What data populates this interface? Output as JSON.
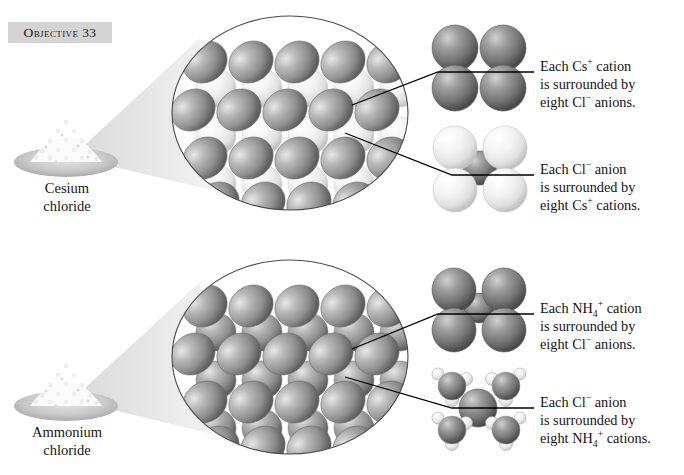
{
  "figure": {
    "objective_label": "Objective 33",
    "panels": [
      {
        "id": "cesium-chloride",
        "pile_caption_line1": "Cesium",
        "pile_caption_line2": "chloride",
        "annotations": [
          {
            "id": "cs-cation",
            "line1_prefix": "Each Cs",
            "line1_charge": "+",
            "line1_suffix": " cation",
            "line2": "is surrounded by",
            "line3_prefix": "eight Cl",
            "line3_charge": "−",
            "line3_suffix": " anions."
          },
          {
            "id": "cl-anion",
            "line1_prefix": "Each Cl",
            "line1_charge": "−",
            "line1_suffix": " anion",
            "line2": "is surrounded by",
            "line3_prefix": "eight Cs",
            "line3_charge": "+",
            "line3_suffix": " cations."
          }
        ]
      },
      {
        "id": "ammonium-chloride",
        "pile_caption_line1": "Ammonium",
        "pile_caption_line2": "chloride",
        "annotations": [
          {
            "id": "nh4-cation",
            "line1_prefix": "Each NH",
            "line1_sub": "4",
            "line1_charge": "+",
            "line1_suffix": " cation",
            "line2": "is surrounded by",
            "line3_prefix": "eight Cl",
            "line3_charge": "−",
            "line3_suffix": " anions."
          },
          {
            "id": "cl-anion-2",
            "line1_prefix": "Each Cl",
            "line1_charge": "−",
            "line1_suffix": " anion",
            "line2": "is surrounded by",
            "line3_prefix": "eight NH",
            "line3_sub": "4",
            "line3_charge": "+",
            "line3_suffix": " cations."
          }
        ]
      }
    ],
    "colors": {
      "badge_background": "#d4d4d4",
      "text": "#141414",
      "anion_sphere": "#8c8c8c",
      "cation_sphere": "#f2f2f2",
      "dish": "#c9c9c9",
      "cone": "#e2e2e2",
      "outline": "#4a4a4a",
      "leader_line": "#000000"
    }
  }
}
